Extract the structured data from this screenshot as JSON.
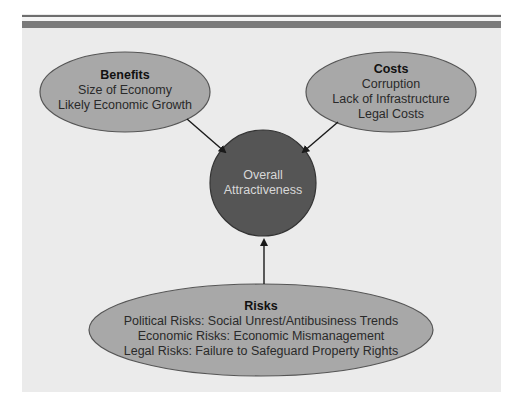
{
  "colors": {
    "panel_background": "#ebebeb",
    "stripe": "#707070",
    "ellipse_fill": "#a8a8a8",
    "ellipse_stroke": "#555555",
    "center_fill": "#555555",
    "center_stroke": "#333333",
    "center_text": "#d8d8d8",
    "arrow": "#1a1a1a"
  },
  "nodes": {
    "benefits": {
      "title": "Benefits",
      "lines": [
        "Size of Economy",
        "Likely Economic Growth"
      ]
    },
    "costs": {
      "title": "Costs",
      "lines": [
        "Corruption",
        "Lack of Infrastructure",
        "Legal Costs"
      ]
    },
    "center": {
      "lines": [
        "Overall",
        "Attractiveness"
      ]
    },
    "risks": {
      "title": "Risks",
      "lines": [
        "Political Risks: Social Unrest/Antibusiness Trends",
        "Economic Risks: Economic Mismanagement",
        "Legal Risks: Failure to Safeguard Property Rights"
      ]
    }
  },
  "edges": [
    {
      "from": "benefits",
      "to": "center"
    },
    {
      "from": "costs",
      "to": "center"
    },
    {
      "from": "risks",
      "to": "center"
    }
  ]
}
